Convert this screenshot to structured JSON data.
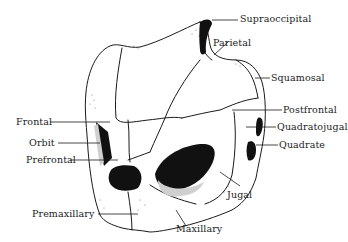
{
  "diagram": {
    "labels": {
      "supraoccipital": "Supraoccipital",
      "parietal": "Parietal",
      "squamosal": "Squamosal",
      "frontal": "Frontal",
      "postfrontal": "Postfrontal",
      "quadratojugal": "Quadratojugal",
      "orbit": "Orbit",
      "quadrate": "Quadrate",
      "prefrontal": "Prefrontal",
      "jugal": "Jugal",
      "premaxillary": "Premaxillary",
      "maxillary": "Maxillary"
    },
    "colors": {
      "ink": "#1a1a1a",
      "background": "#ffffff"
    }
  }
}
